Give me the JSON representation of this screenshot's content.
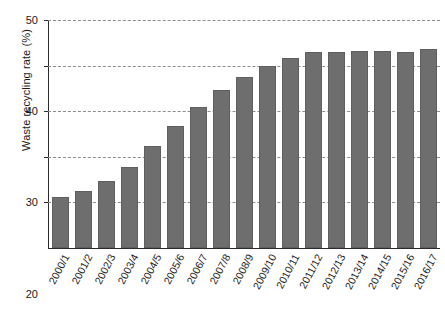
{
  "chart_data": {
    "type": "bar",
    "title": "",
    "xlabel": "",
    "ylabel": "Waste recycling rate (%)",
    "ylim": [
      0,
      50
    ],
    "yticks": [
      10,
      20,
      30,
      40,
      50
    ],
    "ytick_labels": [
      "10",
      "20",
      "30",
      "40",
      "50"
    ],
    "grid": "horizontal-dashed",
    "legend": "none",
    "bar_color": "#6e6e6e",
    "categories": [
      "2000/1",
      "2001/2",
      "2002/3",
      "2003/4",
      "2004/5",
      "2005/6",
      "2006/7",
      "2007/8",
      "2008/9",
      "2009/10",
      "2010/11",
      "2011/12",
      "2012/13",
      "2013/14",
      "2014/15",
      "2015/16",
      "2016/17"
    ],
    "values": [
      11.2,
      12.5,
      14.7,
      17.8,
      22.3,
      26.7,
      30.9,
      34.6,
      37.4,
      40.0,
      41.6,
      42.9,
      43.0,
      43.3,
      43.1,
      42.9,
      43.6
    ]
  }
}
